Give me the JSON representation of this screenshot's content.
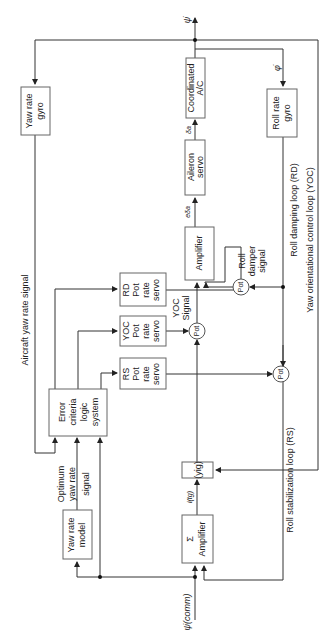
{
  "diagram": {
    "orientation": "rotated 90 degrees counter-clockwise (text reads bottom-to-top)",
    "blocks": {
      "yaw_rate_gyro": [
        "Yaw rate",
        "gyro"
      ],
      "coordinated_ac": [
        "Coordinated",
        "A/C"
      ],
      "roll_rate_gyro": [
        "Roll rate",
        "gyro"
      ],
      "aileron_servo": [
        "Aileron",
        "servo"
      ],
      "amplifier_upper": [
        "Amplifier"
      ],
      "rd_pot_rate_servo": [
        "RD",
        "Pot",
        "rate",
        "servo"
      ],
      "yoc_pot_rate_servo": [
        "YOC",
        "Pot",
        "rate",
        "servo"
      ],
      "rs_pot_rate_servo": [
        "RS",
        "Pot",
        "rate",
        "servo"
      ],
      "error_criteria": [
        "Error",
        "criteria",
        "logic",
        "system"
      ],
      "yig": [
        "(yig)"
      ],
      "sum_amplifier": [
        "Σ",
        "Amplifier"
      ],
      "yaw_rate_model": [
        "Yaw rate",
        "model"
      ]
    },
    "pots": {
      "roll_damper_pot": "Pot",
      "yoc_pot": "Pot",
      "rs_pot": "Pot"
    },
    "signals": {
      "psi_dot_out": "ψ̇",
      "phi_dot": "φ̇",
      "delta_a": "δa",
      "e_delta_a": "eδa",
      "i_tg": "i(tg)",
      "psi_dot_comm": "ψ̇(comm)",
      "aircraft_yaw_rate_signal": "Aircraft yaw rate signal",
      "optimum_yaw_rate_signal": [
        "Optimum",
        "yaw rate",
        "signal"
      ],
      "yoc_signal": [
        "YOC",
        "Signal"
      ],
      "roll_damper_signal": [
        "Roll",
        "damper",
        "signal"
      ]
    },
    "loops": {
      "rd": "Roll damping loop (RD)",
      "yoc": "Yaw orientational control loop (YOC)",
      "rs": "Roll stabilization loop (RS)"
    }
  }
}
